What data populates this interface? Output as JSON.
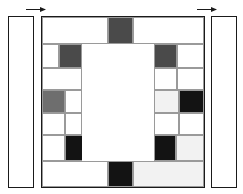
{
  "figure": {
    "title": "",
    "canvas": {
      "width": 243,
      "height": 194,
      "background": "#ffffff"
    },
    "palette": {
      "white": "#ffffff",
      "offwhite": "#f2f2f2",
      "gray": "#6e6e6e",
      "darkgray": "#4a4a4a",
      "black": "#131313",
      "outline": "#1a1a1a",
      "gridline": "#9a9a9a"
    },
    "side_panels": [
      {
        "name": "left-side-panel",
        "label": "",
        "fill": "white",
        "x": 8,
        "y": 16,
        "w": 26,
        "h": 172
      },
      {
        "name": "right-side-panel",
        "label": "",
        "fill": "white",
        "x": 211,
        "y": 16,
        "w": 26,
        "h": 172
      }
    ],
    "markers": [
      {
        "name": "left-arrow-marker",
        "label": "",
        "direction": "right",
        "x": 26,
        "y": 6,
        "w": 20
      },
      {
        "name": "right-arrow-marker",
        "label": "",
        "direction": "right",
        "x": 197,
        "y": 6,
        "w": 20
      }
    ],
    "main_panel": {
      "name": "main-grid-panel",
      "label": "",
      "x": 41,
      "y": 16,
      "w": 164,
      "h": 172
    },
    "cells": [
      {
        "id": "r0c0",
        "fill": "white",
        "x": 42,
        "y": 17,
        "w": 66,
        "h": 27
      },
      {
        "id": "r0c1",
        "fill": "darkgray",
        "x": 108,
        "y": 17,
        "w": 25,
        "h": 27
      },
      {
        "id": "r0c2",
        "fill": "white",
        "x": 133,
        "y": 17,
        "w": 71,
        "h": 27
      },
      {
        "id": "r1c0",
        "fill": "white",
        "x": 42,
        "y": 44,
        "w": 17,
        "h": 24
      },
      {
        "id": "r1c1",
        "fill": "darkgray",
        "x": 59,
        "y": 44,
        "w": 23,
        "h": 24
      },
      {
        "id": "r1c2",
        "fill": "white",
        "x": 82,
        "y": 44,
        "w": 72,
        "h": 24
      },
      {
        "id": "r1c3",
        "fill": "darkgray",
        "x": 154,
        "y": 44,
        "w": 23,
        "h": 24
      },
      {
        "id": "r1c4",
        "fill": "white",
        "x": 177,
        "y": 44,
        "w": 27,
        "h": 24
      },
      {
        "id": "r2c0",
        "fill": "white",
        "x": 42,
        "y": 68,
        "w": 40,
        "h": 22
      },
      {
        "id": "r2c1",
        "fill": "white",
        "x": 82,
        "y": 68,
        "w": 72,
        "h": 22
      },
      {
        "id": "r2c2",
        "fill": "white",
        "x": 154,
        "y": 68,
        "w": 23,
        "h": 22
      },
      {
        "id": "r2c3",
        "fill": "white",
        "x": 177,
        "y": 68,
        "w": 27,
        "h": 22
      },
      {
        "id": "r3c0",
        "fill": "gray",
        "x": 42,
        "y": 90,
        "w": 23,
        "h": 23
      },
      {
        "id": "r3c1",
        "fill": "white",
        "x": 65,
        "y": 90,
        "w": 17,
        "h": 23
      },
      {
        "id": "r3c2",
        "fill": "white",
        "x": 82,
        "y": 90,
        "w": 72,
        "h": 23
      },
      {
        "id": "r3c3",
        "fill": "offwhite",
        "x": 154,
        "y": 90,
        "w": 25,
        "h": 23
      },
      {
        "id": "r3c4",
        "fill": "black",
        "x": 179,
        "y": 90,
        "w": 25,
        "h": 23
      },
      {
        "id": "r4c0",
        "fill": "white",
        "x": 42,
        "y": 113,
        "w": 23,
        "h": 22
      },
      {
        "id": "r4c1",
        "fill": "white",
        "x": 65,
        "y": 113,
        "w": 17,
        "h": 22
      },
      {
        "id": "r4c2",
        "fill": "white",
        "x": 82,
        "y": 113,
        "w": 72,
        "h": 22
      },
      {
        "id": "r4c3",
        "fill": "white",
        "x": 154,
        "y": 113,
        "w": 25,
        "h": 22
      },
      {
        "id": "r4c4",
        "fill": "white",
        "x": 179,
        "y": 113,
        "w": 25,
        "h": 22
      },
      {
        "id": "r5c0",
        "fill": "white",
        "x": 42,
        "y": 135,
        "w": 23,
        "h": 26
      },
      {
        "id": "r5c1",
        "fill": "black",
        "x": 65,
        "y": 135,
        "w": 22,
        "h": 26
      },
      {
        "id": "r5c2",
        "fill": "white",
        "x": 87,
        "y": 135,
        "w": 67,
        "h": 26
      },
      {
        "id": "r5c3",
        "fill": "black",
        "x": 154,
        "y": 135,
        "w": 22,
        "h": 26
      },
      {
        "id": "r5c4",
        "fill": "offwhite",
        "x": 176,
        "y": 135,
        "w": 28,
        "h": 26
      },
      {
        "id": "r6c0",
        "fill": "white",
        "x": 42,
        "y": 161,
        "w": 66,
        "h": 26
      },
      {
        "id": "r6c1",
        "fill": "black",
        "x": 108,
        "y": 161,
        "w": 25,
        "h": 26
      },
      {
        "id": "r6c2",
        "fill": "offwhite",
        "x": 133,
        "y": 161,
        "w": 71,
        "h": 26
      },
      {
        "id": "center-void",
        "fill": "white",
        "x": 82,
        "y": 44,
        "w": 72,
        "h": 117,
        "nogrid": true
      }
    ]
  }
}
